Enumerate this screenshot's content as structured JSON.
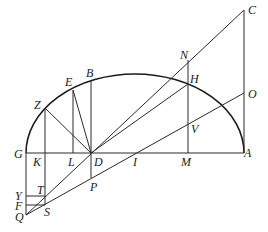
{
  "diagram": {
    "type": "geometric construction",
    "colors": {
      "line": "#2a2a2a",
      "background": "#ffffff"
    },
    "labels": {
      "C": "C",
      "N": "N",
      "H": "H",
      "O": "O",
      "V": "V",
      "E": "E",
      "B": "B",
      "Z": "Z",
      "G": "G",
      "K": "K",
      "L": "L",
      "D": "D",
      "I": "I",
      "M": "M",
      "A": "A",
      "P": "P",
      "Y": "Y",
      "T": "T",
      "F": "F",
      "S": "S",
      "Q": "Q"
    },
    "points": {
      "G": [
        26,
        153
      ],
      "K": [
        45,
        153
      ],
      "L": [
        73,
        153
      ],
      "D": [
        91,
        153
      ],
      "I": [
        137,
        153
      ],
      "M": [
        188,
        153
      ],
      "A": [
        244,
        153
      ],
      "Z": [
        45,
        108
      ],
      "E": [
        73,
        90
      ],
      "B": [
        91,
        80
      ],
      "N": [
        188,
        60
      ],
      "H": [
        188,
        84
      ],
      "V": [
        188,
        123
      ],
      "C": [
        244,
        10
      ],
      "O": [
        244,
        93
      ],
      "P": [
        91,
        178
      ],
      "Q": [
        26,
        215
      ],
      "S": [
        45,
        205
      ],
      "T": [
        45,
        196
      ],
      "Y": [
        26,
        196
      ],
      "F": [
        26,
        205
      ]
    },
    "segments": [
      [
        "G",
        "A"
      ],
      [
        "Q",
        "C"
      ],
      [
        "Q",
        "O"
      ],
      [
        "D",
        "H"
      ],
      [
        "Z",
        "D"
      ],
      [
        "E",
        "D"
      ],
      [
        "Z",
        "S"
      ],
      [
        "E",
        "L"
      ],
      [
        "B",
        "P"
      ],
      [
        "N",
        "M"
      ],
      [
        "C",
        "A"
      ],
      [
        "G",
        "Q"
      ],
      [
        "Y",
        "T"
      ],
      [
        "F",
        "S"
      ]
    ]
  }
}
